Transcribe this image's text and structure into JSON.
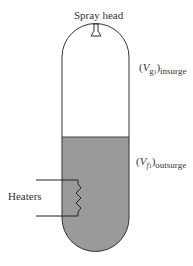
{
  "diagram": {
    "labels": {
      "spray_head": "Spray head",
      "heaters": "Heaters",
      "vapor_insurge": {
        "open": "(",
        "symbol": "V",
        "subscript": "g",
        "subsubscript": "1",
        "close": ")",
        "outer_subscript": "insurge"
      },
      "liquid_outsurge": {
        "open": "(",
        "symbol": "V",
        "subscript": "f",
        "subsubscript": "1",
        "close": ")",
        "outer_subscript": "outsurge"
      }
    },
    "colors": {
      "outline": "#333333",
      "liquid_fill": "#9a9a9a",
      "vapor_fill": "#ffffff"
    },
    "regions": [
      "vapor space",
      "liquid space"
    ]
  }
}
